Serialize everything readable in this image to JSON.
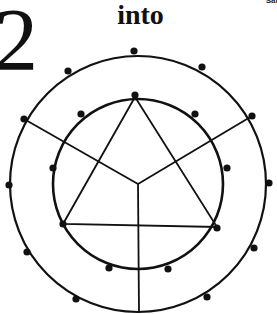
{
  "figure": {
    "number": "2",
    "word": "into",
    "corner_label": "Satu"
  },
  "diagram": {
    "stroke_color": "#111111",
    "background_color": "#ffffff",
    "center": [
      138,
      184
    ],
    "outer_circle": {
      "radius": 128
    },
    "inner_circle": {
      "radius": 85
    },
    "triangle": {
      "vertices": [
        [
          135,
          97
        ],
        [
          63,
          224
        ],
        [
          217,
          227
        ]
      ]
    },
    "spokes": {
      "hub": [
        138,
        184
      ],
      "ends": [
        [
          24,
          119
        ],
        [
          252,
          116
        ],
        [
          139,
          313
        ]
      ]
    },
    "outer_dots": [
      [
        134,
        51
      ],
      [
        202,
        67
      ],
      [
        252,
        116
      ],
      [
        269,
        183
      ],
      [
        254,
        248
      ],
      [
        207,
        297
      ],
      [
        76,
        299
      ],
      [
        27,
        252
      ],
      [
        9,
        185
      ],
      [
        24,
        119
      ],
      [
        68,
        71
      ]
    ],
    "inner_dots": [
      [
        135,
        95
      ],
      [
        195,
        114
      ],
      [
        227,
        168
      ],
      [
        217,
        228
      ],
      [
        168,
        269
      ],
      [
        109,
        268
      ],
      [
        63,
        224
      ],
      [
        53,
        168
      ],
      [
        81,
        114
      ]
    ]
  }
}
